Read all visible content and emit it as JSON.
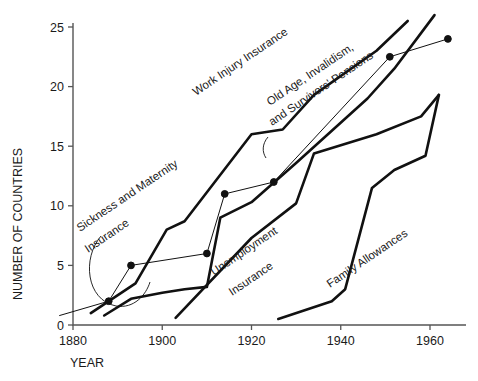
{
  "chart_data": {
    "type": "line",
    "title": "",
    "xlabel": "YEAR",
    "ylabel": "NUMBER OF COUNTRIES",
    "xlim": [
      1876,
      1968
    ],
    "ylim": [
      0,
      25
    ],
    "xticks": [
      1880,
      1900,
      1920,
      1940,
      1960
    ],
    "xtick_labels": [
      "1880",
      "1900",
      "1920",
      "1940",
      "1960"
    ],
    "yticks": [
      0,
      5,
      10,
      15,
      20,
      25
    ],
    "ytick_labels": [
      "0",
      "5",
      "10",
      "15",
      "20",
      "25"
    ],
    "grid": false,
    "legend": "inline-annotations",
    "series": [
      {
        "name": "Work Injury Insurance",
        "style": "thick",
        "markers": false,
        "points": [
          [
            1884,
            1.0
          ],
          [
            1894,
            3.5
          ],
          [
            1901,
            8.0
          ],
          [
            1905,
            8.7
          ],
          [
            1920,
            16.0
          ],
          [
            1927,
            16.4
          ],
          [
            1934,
            19.3
          ],
          [
            1948,
            23.0
          ],
          [
            1955,
            25.5
          ]
        ]
      },
      {
        "name": "Sickness and Maternity Insurance",
        "style": "thick",
        "markers": false,
        "points": [
          [
            1887,
            0.8
          ],
          [
            1893,
            2.2
          ],
          [
            1900,
            2.7
          ],
          [
            1905,
            3.0
          ],
          [
            1910,
            3.2
          ],
          [
            1913,
            9.0
          ],
          [
            1920,
            10.3
          ],
          [
            1930,
            13.6
          ],
          [
            1946,
            19.0
          ],
          [
            1952,
            21.5
          ],
          [
            1961,
            26.0
          ]
        ]
      },
      {
        "name": "Old Age, Invalidism, and Survivors' Pensions",
        "style": "thin",
        "markers": true,
        "points": [
          [
            1877,
            0.8
          ],
          [
            1888,
            2.0
          ],
          [
            1893,
            5.0
          ],
          [
            1910,
            6.0
          ],
          [
            1914,
            11.0
          ],
          [
            1925,
            12.0
          ],
          [
            1951,
            22.5
          ],
          [
            1964,
            24.0
          ]
        ]
      },
      {
        "name": "Unemployment Insurance",
        "style": "thick",
        "markers": false,
        "points": [
          [
            1903,
            0.6
          ],
          [
            1920,
            7.3
          ],
          [
            1930,
            10.2
          ],
          [
            1934,
            14.4
          ],
          [
            1948,
            16.0
          ],
          [
            1958,
            17.5
          ],
          [
            1962,
            19.3
          ]
        ]
      },
      {
        "name": "Family Allowances",
        "style": "thick",
        "markers": false,
        "points": [
          [
            1926,
            0.5
          ],
          [
            1938,
            2.0
          ],
          [
            1941,
            3.0
          ],
          [
            1947,
            11.5
          ],
          [
            1952,
            13.0
          ],
          [
            1959,
            14.2
          ],
          [
            1962,
            19.3
          ]
        ]
      }
    ],
    "annotations": [
      {
        "text": "Work Injury Insurance",
        "x_px": 196,
        "y_px": 96,
        "rotation": -34
      },
      {
        "text": "Sickness and Maternity",
        "x_px": 80,
        "y_px": 232,
        "rotation": -34
      },
      {
        "text": "Insurance",
        "x_px": 88,
        "y_px": 253,
        "rotation": -34
      },
      {
        "text": "Old Age, Invalidism,",
        "x_px": 270,
        "y_px": 106,
        "rotation": -34
      },
      {
        "text": "and Survivors' Pensions",
        "x_px": 272,
        "y_px": 126,
        "rotation": -34
      },
      {
        "text": "Unemployment",
        "x_px": 214,
        "y_px": 276,
        "rotation": -34
      },
      {
        "text": "Insurance",
        "x_px": 232,
        "y_px": 296,
        "rotation": -34
      },
      {
        "text": "Family Allowances",
        "x_px": 330,
        "y_px": 288,
        "rotation": -34
      }
    ]
  }
}
